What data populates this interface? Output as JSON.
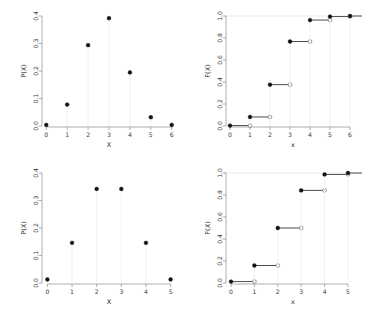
{
  "figure": {
    "title": "",
    "background": "#ffffff",
    "point_color": "#121212",
    "stem_color": "#efefef",
    "axis_color": "#8c8c8c",
    "step_color": "#3a3a3a"
  },
  "chart_data": [
    {
      "type": "scatter",
      "panel": "top-left",
      "title": "",
      "xlabel": "X",
      "ylabel": "P(X)",
      "xlim": [
        -0.3,
        6.3
      ],
      "ylim": [
        0.0,
        0.4
      ],
      "xticks": [
        "0",
        "1",
        "2",
        "3",
        "4",
        "5",
        "6"
      ],
      "xtickvalues": [
        0,
        1,
        2,
        3,
        4,
        5,
        6
      ],
      "yticks": [
        "0.0",
        "0.1",
        "0.2",
        "0.3",
        "0.4"
      ],
      "ytickvalues": [
        0.0,
        0.1,
        0.2,
        0.3,
        0.4
      ],
      "grid": false,
      "marker": "filled-circle",
      "stems": true,
      "x": [
        0,
        1,
        2,
        3,
        4,
        5,
        6
      ],
      "values": [
        0.004,
        0.078,
        0.294,
        0.392,
        0.195,
        0.032,
        0.004
      ]
    },
    {
      "type": "line",
      "panel": "top-right",
      "title": "",
      "xlabel": "x",
      "ylabel": "F(X)",
      "xlim": [
        -0.3,
        6.6
      ],
      "ylim": [
        0.0,
        1.0
      ],
      "xticks": [
        "0",
        "1",
        "2",
        "3",
        "4",
        "5",
        "6"
      ],
      "xtickvalues": [
        0,
        1,
        2,
        3,
        4,
        5,
        6
      ],
      "yticks": [
        "0.0",
        "0.2",
        "0.4",
        "0.6",
        "0.8",
        "1.0"
      ],
      "ytickvalues": [
        0.0,
        0.2,
        0.4,
        0.6,
        0.8,
        1.0
      ],
      "grid": true,
      "gridlines_y": [
        1.0
      ],
      "marker_left": "filled-circle",
      "marker_right": "open-circle",
      "style": "step-ecdf",
      "x": [
        0,
        1,
        2,
        3,
        4,
        5,
        6
      ],
      "values": [
        0.004,
        0.082,
        0.376,
        0.768,
        0.963,
        0.995,
        1.0
      ]
    },
    {
      "type": "scatter",
      "panel": "bottom-left",
      "title": "",
      "xlabel": "X",
      "ylabel": "P(X)",
      "xlim": [
        -0.3,
        5.3
      ],
      "ylim": [
        0.0,
        0.4
      ],
      "xticks": [
        "0",
        "1",
        "2",
        "3",
        "4",
        "5"
      ],
      "xtickvalues": [
        0,
        1,
        2,
        3,
        4,
        5
      ],
      "yticks": [
        "0.0",
        "0.1",
        "0.2",
        "0.3",
        "0.4"
      ],
      "ytickvalues": [
        0.0,
        0.1,
        0.2,
        0.3,
        0.4
      ],
      "grid": false,
      "marker": "filled-circle",
      "stems": true,
      "x": [
        0,
        1,
        2,
        3,
        4,
        5
      ],
      "values": [
        0.013,
        0.146,
        0.342,
        0.342,
        0.146,
        0.013
      ]
    },
    {
      "type": "line",
      "panel": "bottom-right",
      "title": "",
      "xlabel": "x",
      "ylabel": "F(X)",
      "xlim": [
        -0.3,
        5.6
      ],
      "ylim": [
        0.0,
        1.0
      ],
      "xticks": [
        "0",
        "1",
        "2",
        "3",
        "4",
        "5"
      ],
      "xtickvalues": [
        0,
        1,
        2,
        3,
        4,
        5
      ],
      "yticks": [
        "0.0",
        "0.2",
        "0.4",
        "0.6",
        "0.8",
        "1.0"
      ],
      "ytickvalues": [
        0.0,
        0.2,
        0.4,
        0.6,
        0.8,
        1.0
      ],
      "grid": true,
      "gridlines_y": [
        1.0
      ],
      "marker_left": "filled-circle",
      "marker_right": "open-circle",
      "style": "step-ecdf",
      "x": [
        0,
        1,
        2,
        3,
        4,
        5
      ],
      "values": [
        0.013,
        0.159,
        0.5,
        0.842,
        0.987,
        1.0
      ]
    }
  ]
}
